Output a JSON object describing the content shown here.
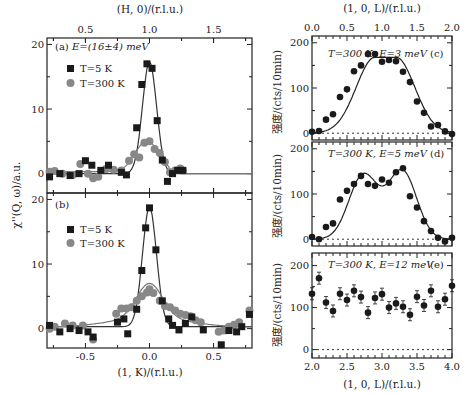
{
  "chart_data": [
    {
      "id": "a",
      "type": "scatter",
      "panel_label": "(a)",
      "annotation": "E=(16±4) meV",
      "xlabel_top": "(H, 0)/(r.l.u.)",
      "top_ticks": [
        "0.5",
        "1.0",
        "1.5"
      ],
      "top_xlim": [
        0.2,
        1.8
      ],
      "ylabel": "χ''(Q, ω)/a.u.",
      "ylim": [
        -3,
        21
      ],
      "yticks": [
        0,
        10,
        20
      ],
      "legend": [
        {
          "name": "T=5 K",
          "marker": "square"
        },
        {
          "name": "T=300 K",
          "marker": "circle"
        }
      ],
      "series": [
        {
          "name": "T=5 K",
          "x": [
            0.22,
            0.3,
            0.38,
            0.45,
            0.5,
            0.55,
            0.62,
            0.68,
            0.78,
            0.82,
            0.9,
            0.94,
            0.98,
            1.02,
            1.06,
            1.1,
            1.14,
            1.18,
            1.22,
            1.26
          ],
          "y": [
            -0.5,
            0,
            -0.3,
            0,
            2,
            1.3,
            0.5,
            1.3,
            0.2,
            -0.2,
            7.1,
            13.8,
            17,
            16.3,
            8.2,
            2.1,
            -1.2,
            0,
            0.5,
            0.5
          ]
        },
        {
          "name": "T=300 K",
          "x": [
            0.22,
            0.26,
            0.32,
            0.4,
            0.46,
            0.52,
            0.56,
            0.6,
            0.66,
            0.72,
            0.78,
            0.84,
            0.88,
            0.92,
            0.96,
            1.0,
            1.04,
            1.08,
            1.12,
            1.16,
            1.2,
            1.24,
            1.26
          ],
          "y": [
            0.3,
            0.4,
            0,
            -0.2,
            1.5,
            0,
            -0.7,
            -0.5,
            0.7,
            0.6,
            0.5,
            2,
            3,
            2.5,
            4.8,
            5,
            3.8,
            3.2,
            1.8,
            0.2,
            0.5,
            0.8,
            0.5
          ]
        }
      ]
    },
    {
      "id": "b",
      "type": "scatter",
      "panel_label": "(b)",
      "xlabel": "(1, K)/(r.l.u.)",
      "xticks": [
        "-0.5",
        "0.0",
        "0.5"
      ],
      "xlim": [
        -0.8,
        0.8
      ],
      "ylim": [
        -3,
        21
      ],
      "yticks": [
        0,
        10,
        20
      ],
      "legend": [
        {
          "name": "T=5 K",
          "marker": "square"
        },
        {
          "name": "T=300 K",
          "marker": "circle"
        }
      ],
      "series": [
        {
          "name": "T=5 K",
          "x": [
            -0.78,
            -0.7,
            -0.62,
            -0.55,
            -0.48,
            -0.44,
            -0.25,
            -0.2,
            -0.17,
            -0.1,
            -0.06,
            -0.03,
            0.0,
            0.05,
            0.1,
            0.15,
            0.18,
            0.23,
            0.28,
            0.33,
            0.42,
            0.56,
            0.62,
            0.68,
            0.72,
            0.78
          ],
          "y": [
            0.5,
            -0.5,
            0,
            -0.3,
            -0.5,
            -1.3,
            1,
            1.5,
            -0.8,
            3,
            9,
            15.6,
            18.7,
            12.2,
            4.3,
            1.5,
            0.5,
            -0.2,
            0.8,
            1.8,
            -0.2,
            -2.5,
            -0.3,
            -0.5,
            0.3,
            2.2
          ]
        },
        {
          "name": "T=300 K",
          "x": [
            -0.78,
            -0.74,
            -0.66,
            -0.6,
            -0.52,
            -0.44,
            -0.26,
            -0.22,
            -0.18,
            -0.14,
            -0.1,
            -0.06,
            -0.02,
            0.0,
            0.03,
            0.08,
            0.12,
            0.16,
            0.2,
            0.24,
            0.28,
            0.32,
            0.36,
            0.4,
            0.54,
            0.58,
            0.62,
            0.66,
            0.7,
            0.78
          ],
          "y": [
            0,
            0.3,
            0.8,
            0.5,
            0.5,
            -1.7,
            2.3,
            3.1,
            3.1,
            3.3,
            4.3,
            5.0,
            5.6,
            6.1,
            5.5,
            4.3,
            3.5,
            3.3,
            2.8,
            2.3,
            2.1,
            1.9,
            1.3,
            1.0,
            -0.5,
            -0.3,
            0.3,
            0.6,
            1.0,
            2.8
          ]
        }
      ]
    },
    {
      "id": "c",
      "type": "scatter",
      "panel_label": "(c)",
      "annotation": "T=300 K, E=3 meV",
      "xlabel_top": "(1, 0, L)/(r.l.u.)",
      "top_ticks": [
        "0.0",
        "0.5",
        "1.0",
        "1.5",
        "2.0"
      ],
      "xlim": [
        0.0,
        2.0
      ],
      "ylabel": "强度/(cts/10min)",
      "ylim": [
        -15,
        215
      ],
      "yticks": [
        0,
        100,
        200
      ],
      "x": [
        0.0,
        0.1,
        0.2,
        0.3,
        0.4,
        0.5,
        0.6,
        0.7,
        0.8,
        0.9,
        1.0,
        1.1,
        1.2,
        1.3,
        1.4,
        1.5,
        1.6,
        1.7,
        1.8,
        1.9,
        2.0
      ],
      "y": [
        3,
        5,
        30,
        42,
        80,
        97,
        137,
        150,
        175,
        175,
        158,
        162,
        159,
        136,
        113,
        70,
        45,
        15,
        18,
        4,
        -2
      ]
    },
    {
      "id": "d",
      "type": "scatter",
      "panel_label": "(d)",
      "annotation": "T=300 K, E=5 meV",
      "ylabel": "强度/(cts/10min)",
      "ylim": [
        -15,
        215
      ],
      "yticks": [
        0,
        100,
        200
      ],
      "x": [
        0.0,
        0.1,
        0.2,
        0.3,
        0.4,
        0.5,
        0.6,
        0.7,
        0.8,
        0.9,
        1.0,
        1.1,
        1.2,
        1.3,
        1.4,
        1.5,
        1.6,
        1.7,
        1.8,
        1.9,
        2.0
      ],
      "y": [
        5,
        0,
        27,
        35,
        88,
        107,
        122,
        140,
        122,
        118,
        132,
        125,
        148,
        157,
        95,
        70,
        40,
        18,
        3,
        -5,
        3
      ]
    },
    {
      "id": "e",
      "type": "scatter",
      "panel_label": "(e)",
      "annotation": "T=300 K, E=12 meV",
      "xlabel": "(1, 0, L)/(r.l.u.)",
      "xticks": [
        "2.0",
        "2.5",
        "3.0",
        "3.5",
        "4.0"
      ],
      "xlim": [
        2.0,
        4.0
      ],
      "ylabel": "强度/(cts/10min)",
      "ylim": [
        -20,
        230
      ],
      "yticks": [
        0,
        100,
        200
      ],
      "x": [
        2.0,
        2.1,
        2.2,
        2.3,
        2.4,
        2.5,
        2.6,
        2.7,
        2.8,
        2.9,
        3.0,
        3.1,
        3.2,
        3.3,
        3.4,
        3.5,
        3.6,
        3.7,
        3.8,
        3.9,
        4.0
      ],
      "y": [
        133,
        170,
        112,
        92,
        133,
        118,
        140,
        125,
        88,
        123,
        132,
        100,
        110,
        102,
        83,
        126,
        105,
        140,
        102,
        120,
        152
      ]
    }
  ],
  "labels": {
    "a_panel": "(a)",
    "a_ann": "E=(16±4) meV",
    "b_panel": "(b)",
    "leg5": "T=5 K",
    "leg300": "T=300 K",
    "left_top_axis": "(H, 0)/(r.l.u.)",
    "left_bottom_axis": "(1, K)/(r.l.u.)",
    "left_ylabel": "χ''(Q, ω)/a.u.",
    "right_top_axis": "(1, 0, L)/(r.l.u.)",
    "right_bottom_axis": "(1, 0, L)/(r.l.u.)",
    "right_ylabel": "强度/(cts/10min)",
    "c_ann": "T=300 K, E=3 meV",
    "c_panel": "(c)",
    "d_ann": "T=300 K, E=5 meV",
    "d_panel": "(d)",
    "e_ann": "T=300 K, E=12 meV",
    "e_panel": "(e)"
  }
}
